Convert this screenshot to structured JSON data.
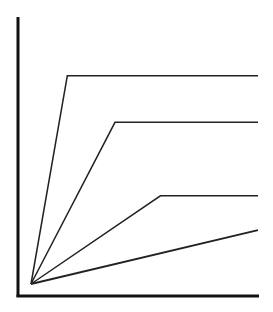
{
  "chart_data": {
    "type": "line",
    "title": "",
    "xlabel": "",
    "ylabel": "",
    "grid": false,
    "legend": null,
    "xlim": [
      0,
      100
    ],
    "ylim": [
      0,
      100
    ],
    "origin": [
      0,
      0
    ],
    "series": [
      {
        "name": "line-1",
        "points": [
          [
            0,
            0
          ],
          [
            16,
            85
          ],
          [
            100,
            85
          ]
        ]
      },
      {
        "name": "line-2",
        "points": [
          [
            0,
            0
          ],
          [
            37,
            66
          ],
          [
            100,
            66
          ]
        ]
      },
      {
        "name": "line-3",
        "points": [
          [
            0,
            0
          ],
          [
            57,
            36
          ],
          [
            100,
            36
          ]
        ]
      },
      {
        "name": "line-4",
        "points": [
          [
            0,
            0
          ],
          [
            100,
            22
          ]
        ]
      }
    ]
  },
  "colors": {
    "axis": "#111111",
    "line": "#222222",
    "background": "#ffffff"
  }
}
